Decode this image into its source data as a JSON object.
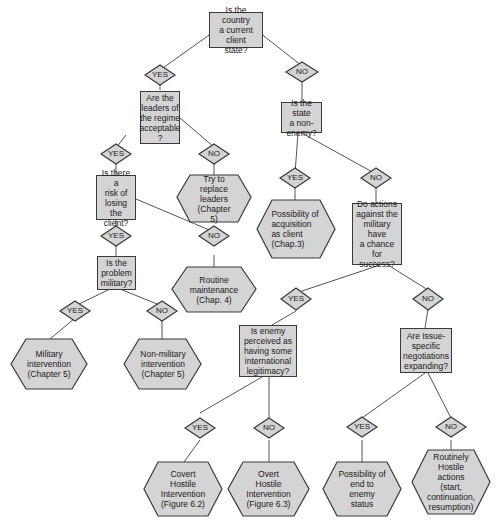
{
  "colors": {
    "fill": "#d4d4d4",
    "stroke": "#3a3a3a",
    "line": "#555555",
    "text": "#1a1a1a",
    "background": "#ffffff"
  },
  "questions": {
    "q_client_state": "Is the country\na current client\nstate?",
    "q_leaders_acceptable": "Are the\nleaders of\nthe regime\nacceptable\n?",
    "q_non_enemy": "Is the state\na non-\nenemy?",
    "q_risk_losing": "Is there a\nrisk of\nlosing the\nclient?",
    "q_actions_military": "Do actions\nagainst the\nmilitary have\na chance for\nsuccess?",
    "q_problem_military": "Is the\nproblem\nmilitary?",
    "q_enemy_legitimacy": "Is enemy\nperceived as\nhaving some\ninternational\nlegitimacy?",
    "q_negotiations": "Are Issue-\nspecific\nnegotiations\nexpanding?"
  },
  "outcomes": {
    "o_replace_leaders": "Try to\nreplace\nleaders\n(Chapter\n5)",
    "o_acquisition": "Possibility of\nacquisition\nas client\n(Chap.3)",
    "o_routine_maintenance": "Routine\nmaintenance\n(Chap. 4)",
    "o_military_intervention": "Military\nintervention\n(Chapter 5)",
    "o_nonmilitary_intervention": "Non-military\nintervention\n(Chapter 5)",
    "o_covert_hostile": "Covert\nHostile\nIntervention\n(Figure 6.2)",
    "o_overt_hostile": "Overt\nHostile\nIntervention\n(Figure 6.3)",
    "o_end_enemy": "Possibility of\nend to\nenemy\nstatus",
    "o_routinely_hostile": "Routinely\nHostile\nactions\n(start,\ncontinuation,\nresumption)"
  },
  "labels": {
    "yes": "YES",
    "no": "NO"
  }
}
